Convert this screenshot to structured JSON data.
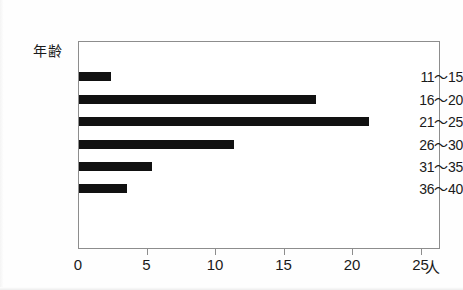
{
  "chart_data": {
    "type": "bar",
    "orientation": "horizontal",
    "title": "",
    "xlabel": "人",
    "ylabel": "年齢",
    "categories": [
      "11〜15",
      "16〜20",
      "21〜25",
      "26〜30",
      "31〜35",
      "36〜40"
    ],
    "values": [
      2.3,
      17.3,
      21.2,
      11.3,
      5.3,
      3.5
    ],
    "xlim": [
      0,
      26.4
    ],
    "xticks": [
      0,
      5,
      10,
      15,
      20,
      25
    ],
    "xtick_labels": [
      "0",
      "5",
      "10",
      "15",
      "20",
      "25"
    ],
    "grid": false,
    "legend": null,
    "bar_color": "#111111",
    "frame_color": "#8d8d8d"
  },
  "axes": {
    "y_axis_title": "年齢",
    "x_unit_label": "人"
  }
}
